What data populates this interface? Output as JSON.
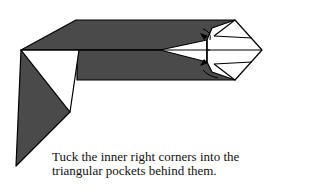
{
  "caption": {
    "line1": "Tuck the inner right corners into the",
    "line2": "triangular pockets behind them."
  },
  "colors": {
    "paper_dark": "#4a4a4a",
    "paper_light": "#ffffff",
    "line": "#000000"
  }
}
